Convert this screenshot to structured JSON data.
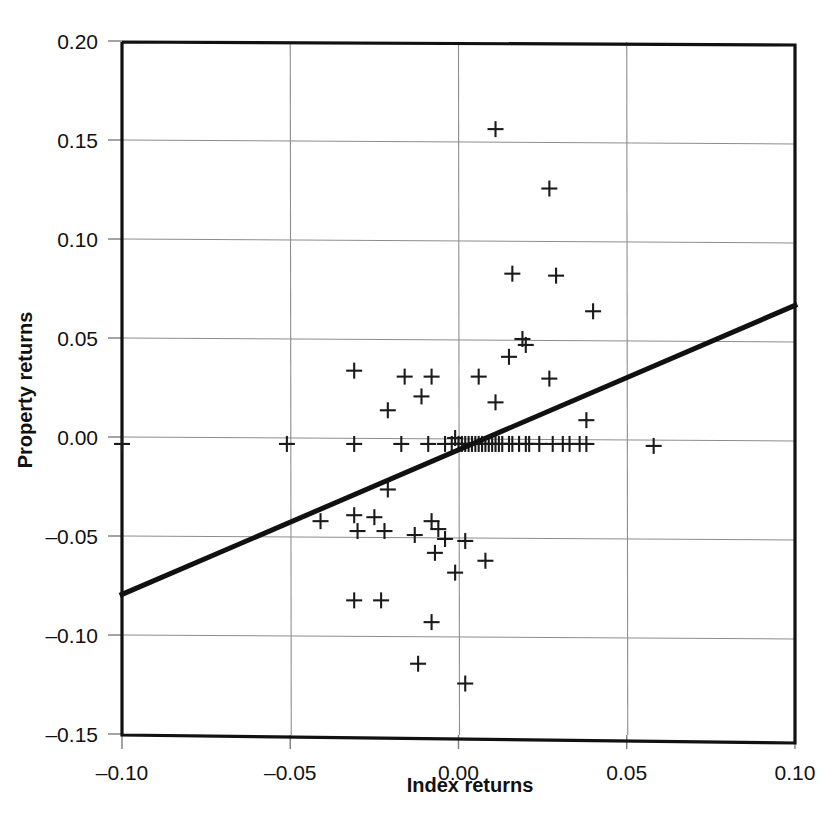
{
  "chart_data": {
    "type": "scatter",
    "title": "",
    "xlabel": "Index returns",
    "ylabel": "Property returns",
    "xlim": [
      -0.1,
      0.1
    ],
    "ylim": [
      -0.15,
      0.2
    ],
    "grid": true,
    "legend": null,
    "xticks": [
      -0.1,
      -0.05,
      0.0,
      0.05,
      0.1
    ],
    "xtick_labels": [
      "–0.10",
      "–0.05",
      "0.00",
      "0.05",
      "0.10"
    ],
    "yticks": [
      -0.15,
      -0.1,
      -0.05,
      0.0,
      0.05,
      0.1,
      0.15,
      0.2
    ],
    "ytick_labels": [
      "–0.15",
      "–0.10",
      "–0.05",
      "0.00",
      "0.05",
      "0.10",
      "0.15",
      "0.20"
    ],
    "marker": "plus",
    "marker_color": "#1a1a1a",
    "trendline": {
      "type": "linear",
      "x": [
        -0.1,
        0.1
      ],
      "y": [
        -0.079,
        0.067
      ],
      "slope": 0.73,
      "intercept": -0.006,
      "color": "#111111"
    },
    "points": [
      [
        0.011,
        0.156
      ],
      [
        0.027,
        0.126
      ],
      [
        0.016,
        0.083
      ],
      [
        0.029,
        0.082
      ],
      [
        0.04,
        0.064
      ],
      [
        0.019,
        0.05
      ],
      [
        0.02,
        0.047
      ],
      [
        0.015,
        0.041
      ],
      [
        -0.031,
        0.034
      ],
      [
        -0.016,
        0.031
      ],
      [
        -0.008,
        0.031
      ],
      [
        0.006,
        0.031
      ],
      [
        0.027,
        0.03
      ],
      [
        -0.011,
        0.021
      ],
      [
        0.011,
        0.018
      ],
      [
        -0.021,
        0.014
      ],
      [
        0.038,
        0.009
      ],
      [
        -0.001,
        0.0
      ],
      [
        -0.1,
        -0.003
      ],
      [
        -0.051,
        -0.003
      ],
      [
        -0.031,
        -0.003
      ],
      [
        -0.017,
        -0.003
      ],
      [
        -0.009,
        -0.003
      ],
      [
        -0.004,
        -0.003
      ],
      [
        -0.002,
        -0.003
      ],
      [
        0.0,
        -0.003
      ],
      [
        0.001,
        -0.003
      ],
      [
        0.002,
        -0.003
      ],
      [
        0.003,
        -0.003
      ],
      [
        0.004,
        -0.003
      ],
      [
        0.005,
        -0.003
      ],
      [
        0.006,
        -0.003
      ],
      [
        0.007,
        -0.003
      ],
      [
        0.008,
        -0.003
      ],
      [
        0.009,
        -0.003
      ],
      [
        0.01,
        -0.003
      ],
      [
        0.011,
        -0.003
      ],
      [
        0.012,
        -0.003
      ],
      [
        0.013,
        -0.003
      ],
      [
        0.015,
        -0.003
      ],
      [
        0.016,
        -0.003
      ],
      [
        0.018,
        -0.003
      ],
      [
        0.02,
        -0.003
      ],
      [
        0.021,
        -0.003
      ],
      [
        0.024,
        -0.003
      ],
      [
        0.028,
        -0.003
      ],
      [
        0.031,
        -0.003
      ],
      [
        0.033,
        -0.003
      ],
      [
        0.036,
        -0.003
      ],
      [
        0.038,
        -0.003
      ],
      [
        0.058,
        -0.004
      ],
      [
        -0.021,
        -0.026
      ],
      [
        -0.041,
        -0.042
      ],
      [
        -0.031,
        -0.039
      ],
      [
        -0.025,
        -0.04
      ],
      [
        -0.03,
        -0.047
      ],
      [
        -0.022,
        -0.047
      ],
      [
        -0.013,
        -0.049
      ],
      [
        -0.008,
        -0.042
      ],
      [
        -0.006,
        -0.046
      ],
      [
        -0.004,
        -0.051
      ],
      [
        -0.007,
        -0.058
      ],
      [
        0.002,
        -0.052
      ],
      [
        0.008,
        -0.062
      ],
      [
        -0.001,
        -0.068
      ],
      [
        -0.031,
        -0.082
      ],
      [
        -0.023,
        -0.082
      ],
      [
        -0.008,
        -0.093
      ],
      [
        -0.012,
        -0.114
      ],
      [
        0.002,
        -0.124
      ]
    ]
  },
  "caption": {
    "text": ""
  }
}
